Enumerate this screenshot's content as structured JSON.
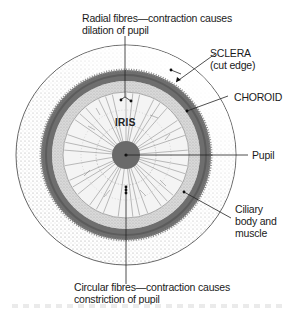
{
  "diagram": {
    "center": [
      126,
      155
    ],
    "labels": {
      "radial_fibres": {
        "line1": "Radial fibres—contraction causes",
        "line2": "dilation of pupil"
      },
      "sclera": {
        "line1": "SCLERA",
        "line2": "(cut edge)"
      },
      "choroid": "CHOROID",
      "iris": "IRIS",
      "pupil": "Pupil",
      "ciliary": {
        "line1": "Ciliary",
        "line2": "body and",
        "line3": "muscle"
      },
      "circular_fibres": {
        "line1": "Circular fibres—contraction causes",
        "line2": "constriction of pupil"
      }
    },
    "colors": {
      "outline": "#555555",
      "choroid": "#6e6e6e",
      "ciliary_light": "#bdbdbd",
      "pupil": "#6a6a6a",
      "stipple": "#9a9a9a",
      "text": "#1a1a1a"
    }
  }
}
